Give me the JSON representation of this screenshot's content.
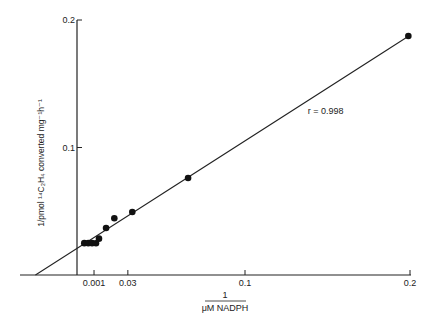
{
  "chart_data": {
    "type": "scatter",
    "title": "",
    "xlabel_numerator": "1",
    "xlabel_denominator": "μM NADPH",
    "ylabel": "1/pmol ¹⁴C₂H₄ converted mg⁻¹h⁻¹",
    "xlim": [
      -0.037,
      0.2
    ],
    "ylim": [
      0,
      0.2
    ],
    "x_ticks": [
      {
        "label": "0.001",
        "value": 0.0085
      },
      {
        "label": "0.03",
        "value": 0.029
      },
      {
        "label": "0.1",
        "value": 0.1
      },
      {
        "label": "0.2",
        "value": 0.2
      }
    ],
    "y_ticks": [
      {
        "label": "0.1",
        "value": 0.1
      },
      {
        "label": "0.2",
        "value": 0.2
      }
    ],
    "grid": false,
    "legend": "none",
    "series": [
      {
        "name": "data",
        "points": [
          {
            "x": 0.0026,
            "y": 0.025
          },
          {
            "x": 0.005,
            "y": 0.025
          },
          {
            "x": 0.0073,
            "y": 0.025
          },
          {
            "x": 0.0097,
            "y": 0.0249
          },
          {
            "x": 0.0115,
            "y": 0.0285
          },
          {
            "x": 0.0158,
            "y": 0.0369
          },
          {
            "x": 0.0208,
            "y": 0.0445
          },
          {
            "x": 0.0317,
            "y": 0.0494
          },
          {
            "x": 0.0655,
            "y": 0.0761
          },
          {
            "x": 0.199,
            "y": 0.1875
          }
        ]
      }
    ],
    "fit_line": {
      "x0": -0.027,
      "y0": 0.0,
      "x1": 0.2,
      "y1": 0.188
    },
    "annotations": [
      {
        "text": "r = 0.998",
        "x": 0.138,
        "y": 0.126
      }
    ]
  }
}
